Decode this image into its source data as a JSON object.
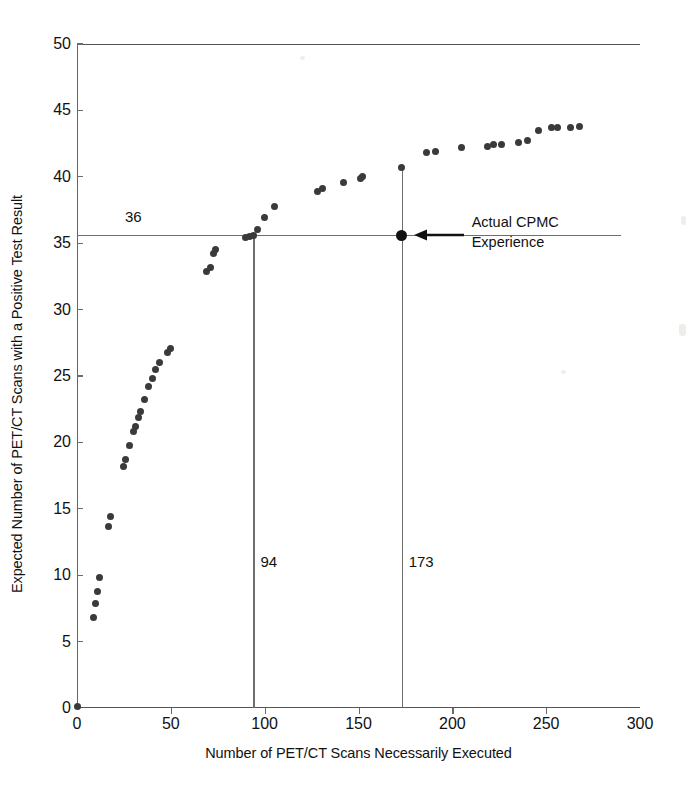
{
  "chart_data": {
    "type": "scatter",
    "title": "",
    "xlabel": "Number of PET/CT Scans Necessarily Executed",
    "ylabel": "Expected Number of PET/CT Scans with a Positive Test Result",
    "xlim": [
      0,
      300
    ],
    "ylim": [
      0,
      50
    ],
    "xticks": [
      0,
      50,
      100,
      150,
      200,
      250,
      300
    ],
    "yticks": [
      0,
      5,
      10,
      15,
      20,
      25,
      30,
      35,
      40,
      45,
      50
    ],
    "grid": false,
    "legend": null,
    "marker_color": "#3a3a3a",
    "guide_color": "#6e6e6e",
    "points": [
      [
        0,
        0.1
      ],
      [
        9,
        6.8
      ],
      [
        10,
        7.9
      ],
      [
        11,
        8.8
      ],
      [
        12,
        9.8
      ],
      [
        17,
        13.7
      ],
      [
        18,
        14.4
      ],
      [
        25,
        18.2
      ],
      [
        26,
        18.7
      ],
      [
        28,
        19.8
      ],
      [
        30,
        20.8
      ],
      [
        31,
        21.2
      ],
      [
        33,
        21.9
      ],
      [
        34,
        22.3
      ],
      [
        36,
        23.2
      ],
      [
        38,
        24.2
      ],
      [
        40,
        24.8
      ],
      [
        42,
        25.5
      ],
      [
        44,
        26.0
      ],
      [
        48,
        26.8
      ],
      [
        50,
        27.1
      ],
      [
        69,
        32.9
      ],
      [
        71,
        33.2
      ],
      [
        73,
        34.2
      ],
      [
        74,
        34.5
      ],
      [
        90,
        35.4
      ],
      [
        92,
        35.5
      ],
      [
        94,
        35.6
      ],
      [
        96,
        36.0
      ],
      [
        100,
        36.9
      ],
      [
        105,
        37.8
      ],
      [
        128,
        38.9
      ],
      [
        131,
        39.1
      ],
      [
        142,
        39.6
      ],
      [
        151,
        39.9
      ],
      [
        152,
        40.0
      ],
      [
        173,
        40.7
      ],
      [
        186,
        41.8
      ],
      [
        191,
        41.9
      ],
      [
        205,
        42.2
      ],
      [
        219,
        42.3
      ],
      [
        222,
        42.4
      ],
      [
        226,
        42.4
      ],
      [
        235,
        42.6
      ],
      [
        240,
        42.7
      ],
      [
        246,
        43.5
      ],
      [
        253,
        43.7
      ],
      [
        256,
        43.7
      ],
      [
        263,
        43.7
      ],
      [
        268,
        43.8
      ]
    ],
    "guides": {
      "horizontal": [
        {
          "y": 35.6,
          "label": "36",
          "from_x": 0,
          "to_x": 290
        }
      ],
      "vertical": [
        {
          "x": 94,
          "label": "94",
          "from_y": 0,
          "to_y": 35.6
        },
        {
          "x": 173,
          "label": "173",
          "from_y": 0,
          "to_y": 40.7
        }
      ]
    },
    "annotations": [
      {
        "name": "actual-cpmc-experience",
        "text_line1": "Actual CPMC",
        "text_line2": "Experience",
        "point_x": 173,
        "point_y": 35.6,
        "arrow": "left-arrow-icon"
      }
    ]
  }
}
